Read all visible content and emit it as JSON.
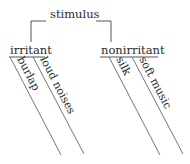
{
  "diagram": {
    "type": "sentence-diagram-tree",
    "root": {
      "label": "stimulus"
    },
    "branches": [
      {
        "label": "irritant",
        "modifiers": [
          {
            "label": "burlap"
          },
          {
            "label": "loud noises"
          }
        ]
      },
      {
        "label": "nonirritant",
        "modifiers": [
          {
            "label": "silk"
          },
          {
            "label": "soft music"
          }
        ]
      }
    ]
  }
}
